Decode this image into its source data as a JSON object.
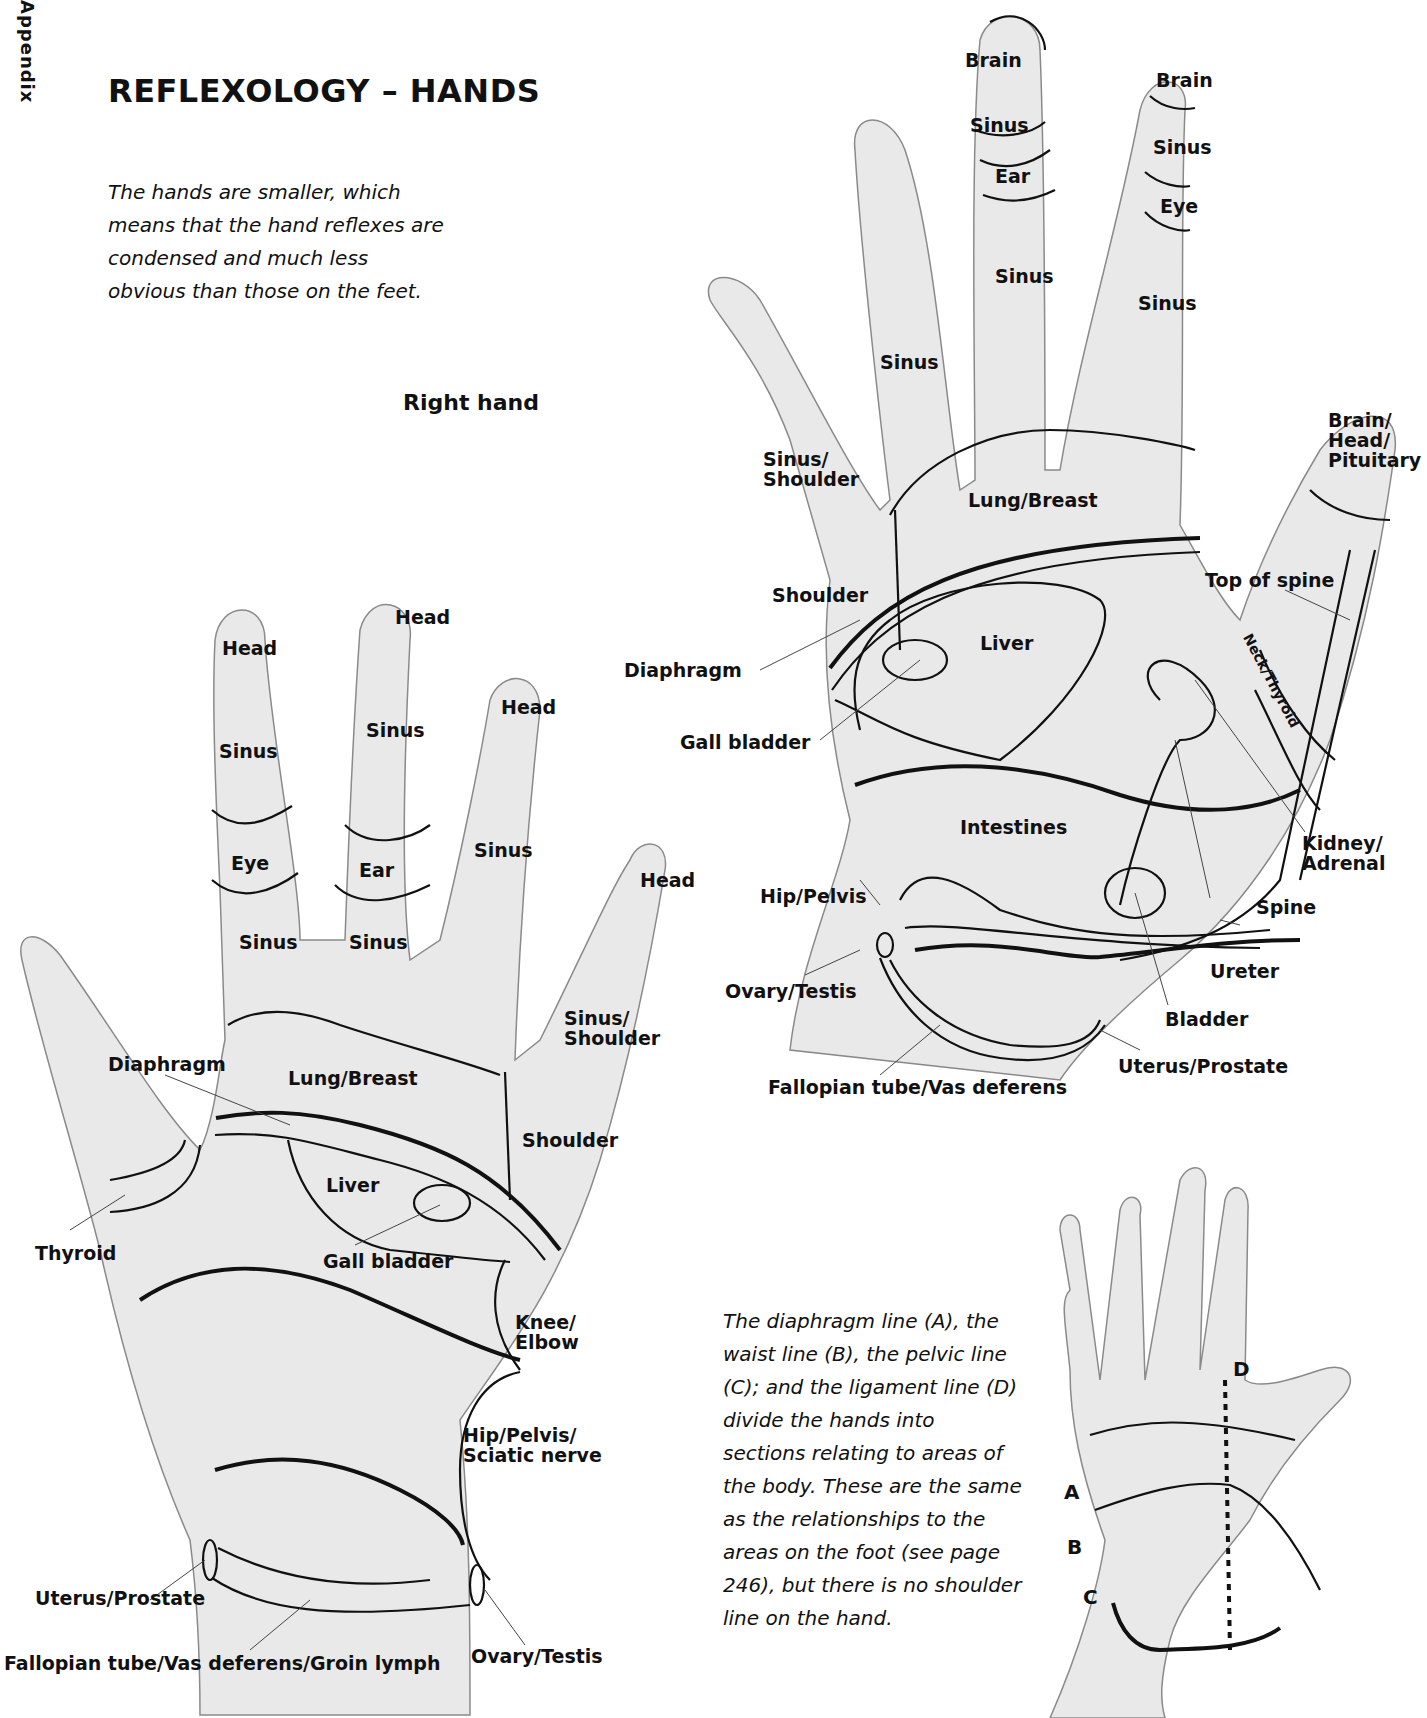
{
  "page": {
    "side_tab": "Appendix",
    "title": "REFLEXOLOGY – HANDS",
    "intro": "The hands are smaller, which means that the hand reflexes are condensed and much less obvious than those on the feet.",
    "right_hand_heading": "Right hand"
  },
  "left_hand_diagram": {
    "fingers": {
      "little": [
        "Sinus/Shoulder"
      ],
      "ring": [
        "Brain",
        "Sinus",
        "Eye",
        "Sinus"
      ],
      "middle": [
        "Brain",
        "Sinus",
        "Ear",
        "Sinus"
      ],
      "index": [
        "Sinus"
      ],
      "thumb": [
        "Brain/Head/Pituitary"
      ]
    },
    "labels": {
      "brain_middle": "Brain",
      "sinus_middle_top": "Sinus",
      "ear_middle": "Ear",
      "sinus_middle_base": "Sinus",
      "brain_ring": "Brain",
      "sinus_ring_top": "Sinus",
      "eye_ring": "Eye",
      "sinus_ring_base": "Sinus",
      "sinus_index": "Sinus",
      "sinus_shoulder": "Sinus/ Shoulder",
      "brain_head_pituitary": "Brain/ Head/ Pituitary",
      "lung_breast": "Lung/Breast",
      "shoulder": "Shoulder",
      "top_of_spine": "Top of spine",
      "diaphragm": "Diaphragm",
      "liver": "Liver",
      "neck_thyroid": "Neck/Thyroid",
      "gall_bladder": "Gall bladder",
      "intestines": "Intestines",
      "kidney_adrenal": "Kidney/ Adrenal",
      "hip_pelvis": "Hip/Pelvis",
      "spine": "Spine",
      "ureter": "Ureter",
      "ovary_testis": "Ovary/Testis",
      "bladder": "Bladder",
      "uterus_prostate": "Uterus/Prostate",
      "fallopian": "Fallopian tube/Vas deferens"
    }
  },
  "right_hand_diagram": {
    "labels": {
      "head_index": "Head",
      "head_middle": "Head",
      "head_ring": "Head",
      "head_little": "Head",
      "sinus_index_top": "Sinus",
      "sinus_middle_top": "Sinus",
      "eye_index": "Eye",
      "ear_middle": "Ear",
      "sinus_index_base": "Sinus",
      "sinus_middle_base": "Sinus",
      "sinus_ring": "Sinus",
      "sinus_shoulder": "Sinus/ Shoulder",
      "diaphragm": "Diaphragm",
      "lung_breast": "Lung/Breast",
      "shoulder": "Shoulder",
      "liver": "Liver",
      "thyroid": "Thyroid",
      "gall_bladder": "Gall bladder",
      "knee_elbow": "Knee/ Elbow",
      "hip_pelvis_sciatic": "Hip/Pelvis/ Sciatic nerve",
      "uterus_prostate": "Uterus/Prostate",
      "fallopian_groin": "Fallopian tube/Vas deferens/Groin lymph",
      "ovary_testis": "Ovary/Testis"
    }
  },
  "lines_diagram": {
    "letters": {
      "a": "A",
      "b": "B",
      "c": "C",
      "d": "D"
    },
    "caption": "The diaphragm line (A), the waist line (B), the pelvic line (C); and the ligament line (D) divide the hands into sections relating to areas of the body. These are the same as the relationships to the areas on the foot (see page 246), but there is no shoulder line on the hand."
  }
}
